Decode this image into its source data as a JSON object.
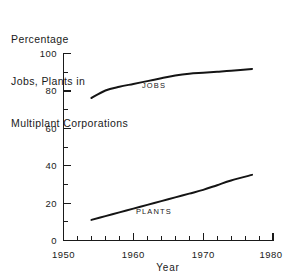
{
  "chart_data": {
    "type": "line",
    "title": "Percentage Jobs, Plants in Multiplant Corporations",
    "title_lines": [
      "Percentage",
      "Jobs, Plants in",
      "Multiplant Corporations"
    ],
    "xlabel": "Year",
    "ylabel": "",
    "xlim": [
      1950,
      1980
    ],
    "ylim": [
      0,
      100
    ],
    "grid": false,
    "legend_position": "inline-labels",
    "x_major_ticks": [
      1950,
      1960,
      1970,
      1980
    ],
    "x_major_tick_labels": [
      "1950",
      "1960",
      "1970",
      "1980"
    ],
    "x_minor_tick_interval": 2,
    "y_major_ticks": [
      0,
      20,
      40,
      60,
      80,
      100
    ],
    "y_major_tick_labels": [
      "0",
      "20",
      "40",
      "60",
      "80",
      "100"
    ],
    "y_minor_tick_interval": 10,
    "series": [
      {
        "name": "JOBS",
        "label": "JOBS",
        "color": "#141414",
        "x": [
          1954,
          1956,
          1958,
          1960,
          1962,
          1964,
          1966,
          1968,
          1970,
          1972,
          1974,
          1977
        ],
        "values": [
          76,
          80,
          82,
          83.5,
          85,
          86.5,
          88,
          89,
          89.5,
          90,
          90.5,
          91.5
        ]
      },
      {
        "name": "PLANTS",
        "label": "PLANTS",
        "color": "#141414",
        "x": [
          1954,
          1956,
          1958,
          1960,
          1962,
          1964,
          1966,
          1968,
          1970,
          1972,
          1974,
          1977
        ],
        "values": [
          11,
          13,
          15,
          17,
          19,
          21,
          23,
          25,
          27,
          29.5,
          32,
          35
        ]
      }
    ]
  },
  "axis": {
    "y_labels": [
      "100",
      "80",
      "60",
      "40",
      "20",
      "0"
    ],
    "x_labels": [
      "1950",
      "1960",
      "1970",
      "1980"
    ],
    "x_axis_title": "Year"
  },
  "series_labels": {
    "jobs": "JOBS",
    "plants": "PLANTS"
  },
  "colors": {
    "ink": "#141414",
    "background": "#ffffff"
  }
}
